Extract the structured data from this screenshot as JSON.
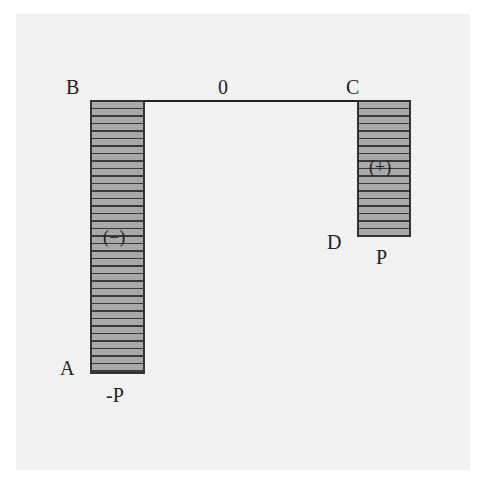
{
  "diagram": {
    "type": "bending-moment-diagram",
    "points": {
      "A": "A",
      "B": "B",
      "C": "C",
      "D": "D"
    },
    "axis_label": "0",
    "segments": [
      {
        "name": "AB",
        "sign": "(−)",
        "end_value": "-P"
      },
      {
        "name": "CD",
        "sign": "(+)",
        "end_value": "P"
      }
    ],
    "colors": {
      "fill": "#a9a9a9",
      "stripe": "#3a3a3a",
      "outline": "#333333",
      "background": "#f1f1f1"
    }
  }
}
